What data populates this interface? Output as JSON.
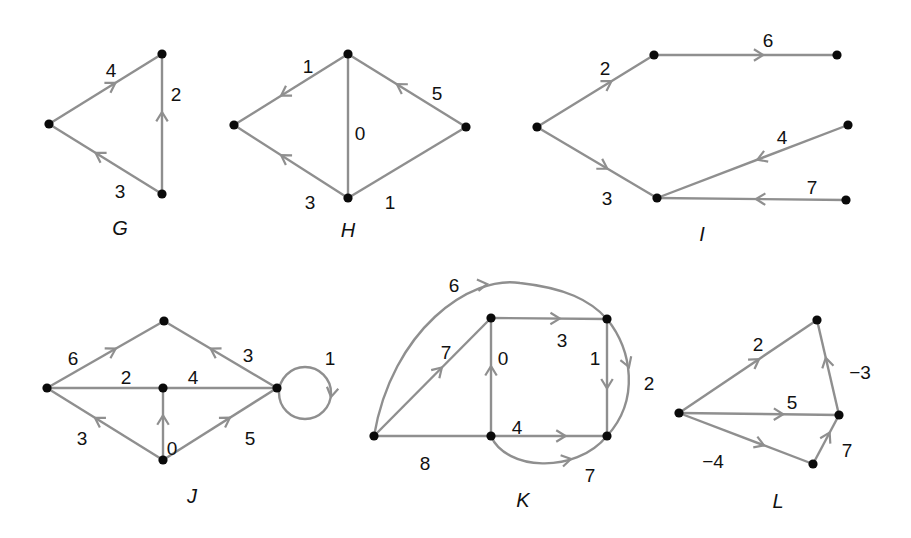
{
  "colors": {
    "edge": "#8f8f8f",
    "node": "#0a0a0a",
    "text": "#111111",
    "background": "#ffffff"
  },
  "graphs": [
    {
      "name": "G",
      "label": "G",
      "label_pos": [
        120,
        230
      ],
      "nodes": [
        [
          49,
          124
        ],
        [
          162,
          54
        ],
        [
          162,
          194
        ]
      ],
      "edges": [
        {
          "from": 0,
          "to": 1,
          "weight": "4",
          "label_pos": [
            111,
            72
          ],
          "arrow_t": 0.55
        },
        {
          "from": 2,
          "to": 1,
          "weight": "2",
          "label_pos": [
            176,
            96
          ],
          "arrow_t": 0.55
        },
        {
          "from": 2,
          "to": 0,
          "weight": "3",
          "label_pos": [
            120,
            193
          ],
          "arrow_t": 0.55
        }
      ]
    },
    {
      "name": "H",
      "label": "H",
      "label_pos": [
        348,
        232
      ],
      "nodes": [
        [
          234,
          125
        ],
        [
          348,
          54
        ],
        [
          466,
          127
        ],
        [
          348,
          198
        ]
      ],
      "edges": [
        {
          "from": 1,
          "to": 0,
          "weight": "1",
          "label_pos": [
            308,
            68
          ],
          "arrow_t": 0.55
        },
        {
          "from": 2,
          "to": 1,
          "weight": "5",
          "label_pos": [
            437,
            95
          ],
          "arrow_t": 0.55
        },
        {
          "from": 1,
          "to": 3,
          "weight": "0",
          "label_pos": [
            360,
            135
          ],
          "directed": false
        },
        {
          "from": 3,
          "to": 0,
          "weight": "3",
          "label_pos": [
            310,
            204
          ],
          "arrow_t": 0.55
        },
        {
          "from": 3,
          "to": 2,
          "weight": "1",
          "label_pos": [
            390,
            204
          ],
          "directed": false
        }
      ]
    },
    {
      "name": "I",
      "label": "I",
      "label_pos": [
        702,
        236
      ],
      "nodes": [
        [
          537,
          127
        ],
        [
          654,
          55
        ],
        [
          837,
          55
        ],
        [
          657,
          198
        ],
        [
          848,
          125
        ],
        [
          846,
          200
        ]
      ],
      "edges": [
        {
          "from": 0,
          "to": 1,
          "weight": "2",
          "label_pos": [
            605,
            70
          ],
          "arrow_t": 0.6
        },
        {
          "from": 1,
          "to": 2,
          "weight": "6",
          "label_pos": [
            768,
            42
          ],
          "arrow_t": 0.57
        },
        {
          "from": 0,
          "to": 3,
          "weight": "3",
          "label_pos": [
            607,
            200
          ],
          "arrow_t": 0.55
        },
        {
          "from": 4,
          "to": 3,
          "weight": "4",
          "label_pos": [
            782,
            139
          ],
          "arrow_t": 0.45
        },
        {
          "from": 5,
          "to": 3,
          "weight": "7",
          "label_pos": [
            812,
            189
          ],
          "arrow_t": 0.45
        }
      ]
    },
    {
      "name": "J",
      "label": "J",
      "label_pos": [
        192,
        498
      ],
      "nodes": [
        [
          47,
          388
        ],
        [
          164,
          321
        ],
        [
          163,
          388
        ],
        [
          163,
          460
        ],
        [
          277,
          388
        ]
      ],
      "loop": {
        "node": 4,
        "cx": 305,
        "cy": 393,
        "r": 26,
        "weight": "1",
        "label_pos": [
          330,
          360
        ]
      },
      "edges": [
        {
          "from": 0,
          "to": 1,
          "weight": "6",
          "label_pos": [
            73,
            360
          ],
          "arrow_t": 0.55
        },
        {
          "from": 4,
          "to": 1,
          "weight": "3",
          "label_pos": [
            248,
            357
          ],
          "arrow_t": 0.55
        },
        {
          "from": 0,
          "to": 2,
          "weight": "2",
          "label_pos": [
            126,
            379
          ],
          "directed": false
        },
        {
          "from": 2,
          "to": 4,
          "weight": "4",
          "label_pos": [
            193,
            379
          ],
          "directed": false
        },
        {
          "from": 3,
          "to": 0,
          "weight": "3",
          "label_pos": [
            82,
            440
          ],
          "arrow_t": 0.55
        },
        {
          "from": 3,
          "to": 2,
          "weight": "0",
          "label_pos": [
            172,
            450
          ],
          "arrow_t": 0.55
        },
        {
          "from": 3,
          "to": 4,
          "weight": "5",
          "label_pos": [
            250,
            440
          ],
          "arrow_t": 0.55
        }
      ]
    },
    {
      "name": "K",
      "label": "K",
      "label_pos": [
        523,
        502
      ],
      "nodes": [
        [
          374,
          436
        ],
        [
          491,
          318
        ],
        [
          607,
          319
        ],
        [
          491,
          436
        ],
        [
          607,
          436
        ]
      ],
      "curves": [
        {
          "from": 0,
          "to": 2,
          "weight": "6",
          "path": "M374,436 C392,330 470,275 520,283 C565,288 590,300 607,319",
          "label_pos": [
            454,
            287
          ],
          "arrow_at": [
            487,
            284
          ],
          "arrow_angle": -8
        },
        {
          "from": 2,
          "to": 4,
          "weight": "2",
          "path": "M607,319 C632,350 640,400 607,436",
          "label_pos": [
            649,
            385
          ],
          "arrow_at": [
            629,
            367
          ],
          "arrow_angle": 70
        },
        {
          "from": 3,
          "to": 4,
          "weight": "7",
          "path": "M491,436 C505,470 575,475 607,436",
          "label_pos": [
            590,
            477
          ],
          "arrow_at": [
            571,
            459
          ],
          "arrow_angle": -12
        }
      ],
      "edges": [
        {
          "from": 0,
          "to": 1,
          "weight": "7",
          "label_pos": [
            446,
            354
          ],
          "arrow_t": 0.55
        },
        {
          "from": 1,
          "to": 2,
          "weight": "3",
          "label_pos": [
            562,
            342
          ],
          "arrow_t": 0.55
        },
        {
          "from": 3,
          "to": 1,
          "weight": "0",
          "label_pos": [
            503,
            360
          ],
          "arrow_t": 0.55
        },
        {
          "from": 2,
          "to": 4,
          "weight": "1",
          "label_pos": [
            595,
            360
          ],
          "arrow_t": 0.55
        },
        {
          "from": 3,
          "to": 4,
          "weight": "4",
          "label_pos": [
            517,
            429
          ],
          "arrow_t": 0.6
        },
        {
          "from": 0,
          "to": 3,
          "weight": "8",
          "label_pos": [
            425,
            465
          ],
          "directed": false
        }
      ]
    },
    {
      "name": "L",
      "label": "L",
      "label_pos": [
        778,
        503
      ],
      "nodes": [
        [
          679,
          413
        ],
        [
          817,
          320
        ],
        [
          839,
          415
        ],
        [
          813,
          464
        ]
      ],
      "edges": [
        {
          "from": 0,
          "to": 1,
          "weight": "2",
          "label_pos": [
            758,
            346
          ],
          "arrow_t": 0.55
        },
        {
          "from": 2,
          "to": 1,
          "weight": "-3",
          "label_pos": [
            860,
            374
          ],
          "arrow_t": 0.55
        },
        {
          "from": 0,
          "to": 2,
          "weight": "5",
          "label_pos": [
            792,
            404
          ],
          "arrow_t": 0.62
        },
        {
          "from": 0,
          "to": 3,
          "weight": "-4",
          "label_pos": [
            713,
            463
          ],
          "arrow_t": 0.6
        },
        {
          "from": 3,
          "to": 2,
          "weight": "7",
          "label_pos": [
            847,
            452
          ],
          "arrow_t": 0.55
        }
      ]
    }
  ]
}
